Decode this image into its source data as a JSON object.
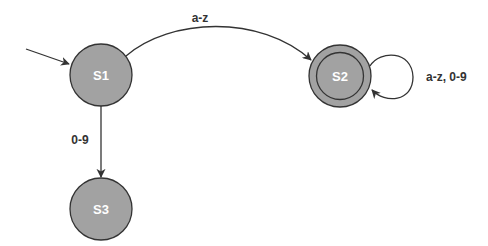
{
  "diagram": {
    "type": "finite-state-machine",
    "colors": {
      "state_fill": "#a2a2a2",
      "stroke": "#333333",
      "state_text": "#ffffff",
      "label_text": "#333333",
      "background": "#ffffff"
    },
    "states": [
      {
        "id": "S1",
        "label": "S1",
        "initial": true,
        "accepting": false,
        "cx": 101,
        "cy": 75,
        "r": 31
      },
      {
        "id": "S2",
        "label": "S2",
        "initial": false,
        "accepting": true,
        "cx": 340,
        "cy": 76,
        "r": 31
      },
      {
        "id": "S3",
        "label": "S3",
        "initial": false,
        "accepting": false,
        "cx": 101,
        "cy": 209,
        "r": 31
      }
    ],
    "transitions": [
      {
        "from": "S1",
        "to": "S2",
        "label": "a-z"
      },
      {
        "from": "S1",
        "to": "S3",
        "label": "0-9"
      },
      {
        "from": "S2",
        "to": "S2",
        "label": "a-z, 0-9"
      }
    ]
  }
}
